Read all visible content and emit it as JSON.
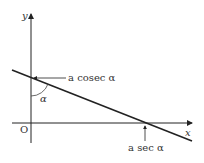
{
  "diagram": {
    "axes": {
      "x_label": "x",
      "y_label": "y",
      "origin_label": "O"
    },
    "line": {
      "description": "straight line crossing both axes with negative gradient"
    },
    "angle_label": "α",
    "y_intercept_label": "a cosec α",
    "x_intercept_label": "a sec α",
    "colors": {
      "stroke": "#222222",
      "text": "#333333",
      "background": "#ffffff"
    }
  }
}
